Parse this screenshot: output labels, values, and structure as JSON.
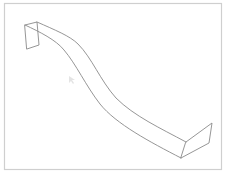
{
  "view": {
    "description": "Isometric wireframe of a twisted sheet strip in a CAD viewport",
    "background_color": "#ffffff",
    "frame_color": "#cfcfcf",
    "line_color": "#8a8a8a"
  },
  "model": {
    "name": "twisted-strip",
    "parts": [
      "left-end-face",
      "strip-upper-edge",
      "strip-lower-edge",
      "right-end-face"
    ]
  },
  "cursor": {
    "icon": "mouse-pointer-icon"
  }
}
